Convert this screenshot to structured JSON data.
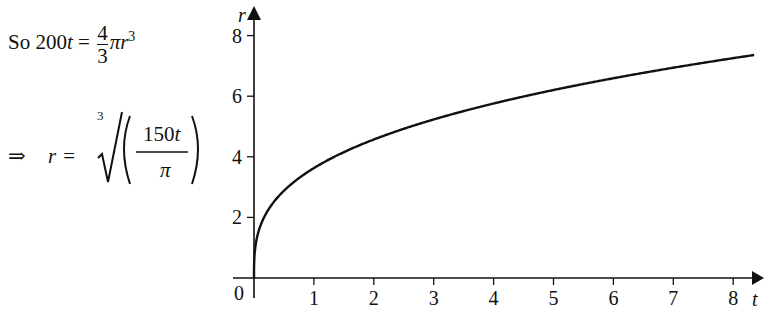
{
  "equations": {
    "line1": {
      "prefix": "So 200",
      "var_t": "t",
      "equals": " = ",
      "frac_num": "4",
      "frac_den": "3",
      "pi": "π",
      "var_r": "r",
      "exp": "3"
    },
    "line2": {
      "implies": "⇒",
      "var_r": "r",
      "equals": " = ",
      "root_index": "3",
      "frac_num": "150",
      "var_t": "t",
      "frac_den": "π"
    }
  },
  "chart_data": {
    "type": "line",
    "title": "",
    "xlabel": "t",
    "ylabel": "r",
    "origin_label": "0",
    "xlim": [
      0,
      8.4
    ],
    "ylim": [
      0,
      8.4
    ],
    "x_ticks": [
      1,
      2,
      3,
      4,
      5,
      6,
      7,
      8
    ],
    "x_tick_labels": [
      "1",
      "2",
      "3",
      "4",
      "5",
      "6",
      "7",
      "8"
    ],
    "y_ticks": [
      2,
      4,
      6,
      8
    ],
    "y_tick_labels": [
      "2",
      "4",
      "6",
      "8"
    ],
    "grid": false,
    "legend": null,
    "function": "r = (150t/π)^(1/3)",
    "series": [
      {
        "name": "r(t)",
        "x": [
          0,
          0.05,
          0.1,
          0.25,
          0.5,
          0.75,
          1,
          1.5,
          2,
          2.5,
          3,
          3.5,
          4,
          4.5,
          5,
          5.5,
          6,
          6.5,
          7,
          7.5,
          8,
          8.35
        ],
        "values": [
          0,
          1.34,
          1.68,
          2.29,
          2.88,
          3.3,
          3.63,
          4.16,
          4.57,
          4.93,
          5.23,
          5.51,
          5.76,
          5.99,
          6.2,
          6.4,
          6.59,
          6.77,
          6.93,
          7.1,
          7.25,
          7.36
        ]
      }
    ]
  }
}
